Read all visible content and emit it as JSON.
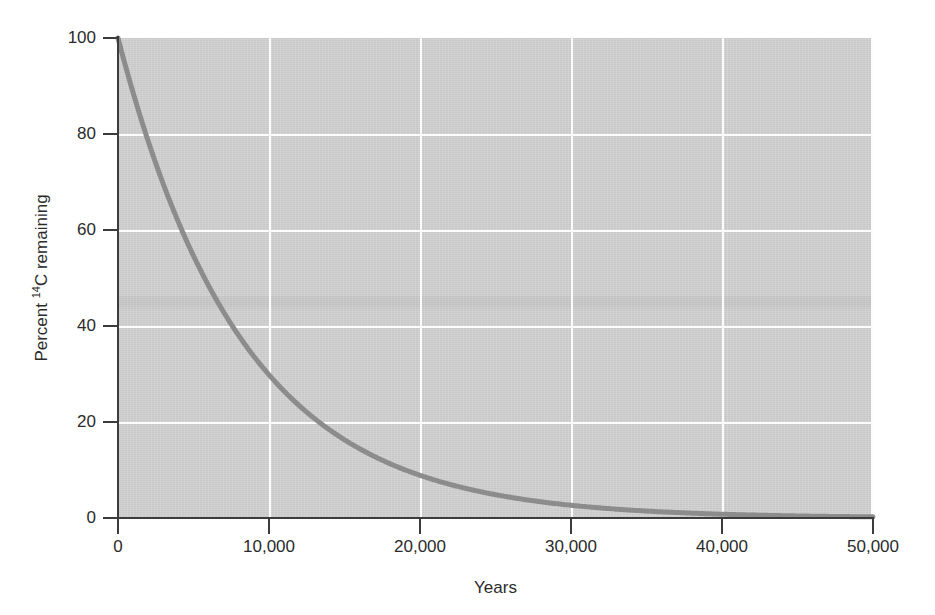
{
  "chart_data": {
    "type": "line",
    "title": "",
    "xlabel": "Years",
    "ylabel": "Percent 14C remaining",
    "ylabel_prefix": "Percent ",
    "ylabel_superscript": "14",
    "ylabel_suffix": "C remaining",
    "xlim": [
      0,
      50000
    ],
    "ylim": [
      0,
      100
    ],
    "grid": true,
    "legend": false,
    "legend_position": "none",
    "xticks": [
      0,
      10000,
      20000,
      30000,
      40000,
      50000
    ],
    "xticklabels": [
      "0",
      "10,000",
      "20,000",
      "30,000",
      "40,000",
      "50,000"
    ],
    "yticks": [
      0,
      20,
      40,
      60,
      80,
      100
    ],
    "yticklabels": [
      "0",
      "20",
      "40",
      "60",
      "80",
      "100"
    ],
    "series": [
      {
        "name": "Carbon-14 remaining",
        "half_life_years": 5730,
        "color": "#8c8c8c",
        "line_width": 5,
        "x": [
          0,
          1000,
          2000,
          3000,
          4000,
          5000,
          5730,
          6000,
          7000,
          8000,
          9000,
          10000,
          11460,
          12000,
          13000,
          14000,
          15000,
          16000,
          17000,
          17190,
          18000,
          19000,
          20000,
          21000,
          22000,
          22920,
          24000,
          26000,
          28000,
          28650,
          30000,
          32000,
          34000,
          34380,
          36000,
          38000,
          40000,
          40110,
          42000,
          44000,
          45840,
          46000,
          48000,
          50000
        ],
        "y": [
          100,
          88.6,
          78.5,
          69.6,
          61.7,
          54.7,
          50,
          48.4,
          42.9,
          38.1,
          33.7,
          29.9,
          25,
          23.5,
          20.8,
          18.5,
          16.4,
          14.5,
          12.8,
          12.5,
          11.4,
          10.1,
          8.9,
          7.9,
          7.0,
          6.25,
          5.4,
          4.3,
          3.4,
          3.125,
          2.6,
          2.0,
          1.6,
          1.5625,
          1.3,
          1.0,
          0.8,
          0.78,
          0.6,
          0.5,
          0.39,
          0.39,
          0.3,
          0.24
        ]
      }
    ]
  },
  "axes": {
    "background_color": "#d3d3d3",
    "gridline_color": "#ffffff",
    "spine_color": "#3c3c3c",
    "tick_color": "#3c3c3c",
    "text_color": "#2b2b2b"
  },
  "page": {
    "background_color": "#ffffff"
  }
}
